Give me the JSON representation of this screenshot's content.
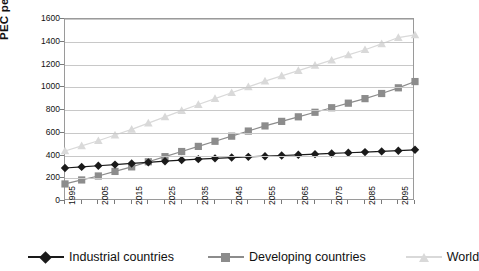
{
  "chart_data": {
    "type": "line",
    "title": "",
    "xlabel": "",
    "ylabel": "PEC per year in [EJ]",
    "xlim": [
      1995,
      2100
    ],
    "ylim": [
      0,
      1600
    ],
    "ytick_step": 200,
    "grid": true,
    "legend_position": "bottom",
    "x_tick_labels": [
      "1995",
      "2005",
      "2015",
      "2025",
      "2035",
      "2045",
      "2055",
      "2065",
      "2075",
      "2085",
      "2095"
    ],
    "y_tick_labels": [
      "0",
      "200",
      "400",
      "600",
      "800",
      "1000",
      "1200",
      "1400",
      "1600"
    ],
    "x": [
      1995,
      2000,
      2005,
      2010,
      2015,
      2020,
      2025,
      2030,
      2035,
      2040,
      2045,
      2050,
      2055,
      2060,
      2065,
      2070,
      2075,
      2080,
      2085,
      2090,
      2095,
      2100
    ],
    "series": [
      {
        "name": "Industrial countries",
        "color": "#1a1a1a",
        "marker": "diamond",
        "values": [
          290,
          300,
          310,
          320,
          330,
          340,
          350,
          360,
          368,
          375,
          382,
          388,
          394,
          400,
          406,
          412,
          418,
          424,
          430,
          436,
          442,
          450
        ]
      },
      {
        "name": "Developing countries",
        "color": "#8c8c8c",
        "marker": "square",
        "values": [
          150,
          185,
          220,
          260,
          300,
          345,
          390,
          435,
          480,
          525,
          570,
          615,
          660,
          700,
          740,
          780,
          820,
          860,
          900,
          945,
          995,
          1050
        ]
      },
      {
        "name": "World",
        "color": "#d9d9d9",
        "marker": "triangle",
        "values": [
          440,
          485,
          530,
          580,
          630,
          685,
          740,
          795,
          848,
          900,
          952,
          1003,
          1054,
          1100,
          1146,
          1192,
          1238,
          1284,
          1330,
          1381,
          1437,
          1460
        ]
      }
    ]
  },
  "legend": {
    "items": [
      {
        "label": "Industrial countries"
      },
      {
        "label": "Developing countries"
      },
      {
        "label": "World"
      }
    ]
  },
  "axes": {
    "y_title": "PEC per year in [EJ]"
  }
}
